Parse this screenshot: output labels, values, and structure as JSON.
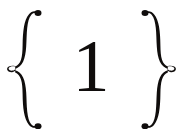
{
  "canvas": {
    "width": 183,
    "height": 135,
    "background_color": "#ffffff",
    "ink_color": "#100d0c"
  },
  "content": {
    "left_brace": "{",
    "numeral": "1",
    "right_brace": "}",
    "full_text": "{ 1 }"
  },
  "icons": {
    "left_brace_name": "ornate-left-curly-brace-icon",
    "right_brace_name": "ornate-right-curly-brace-icon"
  }
}
